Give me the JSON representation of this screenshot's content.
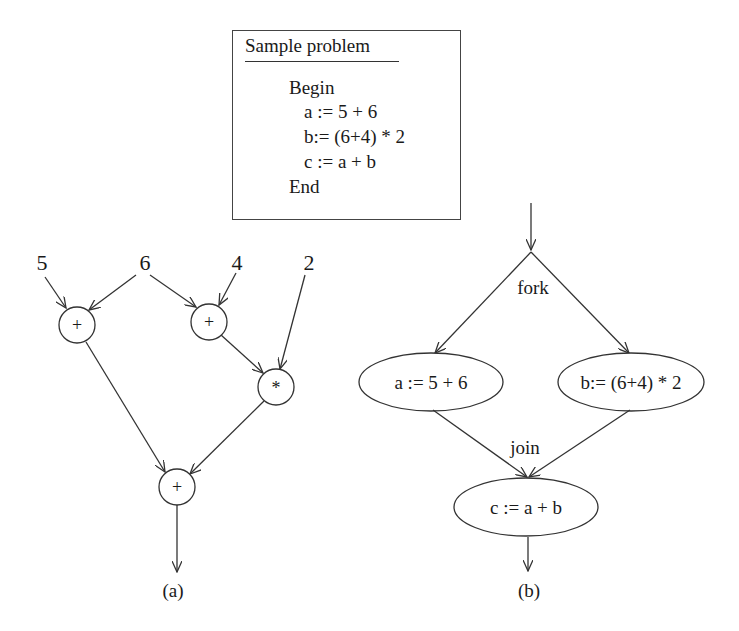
{
  "problem_box": {
    "title": "Sample problem",
    "lines": [
      {
        "text": "Begin",
        "indent": 0
      },
      {
        "text": "a := 5 + 6",
        "indent": 1
      },
      {
        "text": "b:= (6+4) * 2",
        "indent": 1
      },
      {
        "text": "c := a + b",
        "indent": 1
      },
      {
        "text": "End",
        "indent": 0
      }
    ]
  },
  "graph_a": {
    "caption": "(a)",
    "inputs": {
      "in1": "5",
      "in2": "6",
      "in3": "4",
      "in4": "2"
    },
    "nodes": {
      "add1": "+",
      "add2": "+",
      "mul": "*",
      "add3": "+"
    },
    "edges": [
      [
        "5",
        "add1"
      ],
      [
        "6",
        "add1"
      ],
      [
        "6",
        "add2"
      ],
      [
        "4",
        "add2"
      ],
      [
        "add2",
        "mul"
      ],
      [
        "2",
        "mul"
      ],
      [
        "add1",
        "add3"
      ],
      [
        "mul",
        "add3"
      ],
      [
        "add3",
        "output"
      ]
    ]
  },
  "graph_b": {
    "caption": "(b)",
    "fork_label": "fork",
    "join_label": "join",
    "nodes": {
      "task_a": "a := 5 + 6",
      "task_b": "b:= (6+4) * 2",
      "task_c": "c := a + b"
    },
    "edges": [
      [
        "entry",
        "fork"
      ],
      [
        "fork",
        "task_a"
      ],
      [
        "fork",
        "task_b"
      ],
      [
        "task_a",
        "join"
      ],
      [
        "task_b",
        "join"
      ],
      [
        "join",
        "task_c"
      ],
      [
        "task_c",
        "exit"
      ]
    ]
  }
}
